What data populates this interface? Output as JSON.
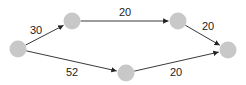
{
  "diagram": {
    "type": "directed-weighted-graph",
    "node_color": "#c8c8c8",
    "edge_color": "#222222",
    "nodes": [
      {
        "id": "A",
        "x": 18,
        "y": 49
      },
      {
        "id": "B",
        "x": 72,
        "y": 21
      },
      {
        "id": "C",
        "x": 178,
        "y": 21
      },
      {
        "id": "D",
        "x": 126,
        "y": 73
      },
      {
        "id": "E",
        "x": 228,
        "y": 50
      }
    ],
    "edges": [
      {
        "from": "A",
        "to": "B",
        "weight": "30",
        "lx": 36,
        "ly": 34
      },
      {
        "from": "B",
        "to": "C",
        "weight": "20",
        "lx": 125,
        "ly": 16
      },
      {
        "from": "C",
        "to": "E",
        "weight": "20",
        "lx": 208,
        "ly": 30
      },
      {
        "from": "A",
        "to": "D",
        "weight": "52",
        "lx": 72,
        "ly": 76
      },
      {
        "from": "D",
        "to": "E",
        "weight": "20",
        "lx": 176,
        "ly": 76
      }
    ]
  }
}
